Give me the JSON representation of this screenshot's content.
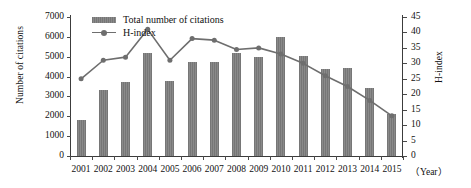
{
  "chart_data": {
    "type": "bar",
    "title": "",
    "xlabel": "（Year）",
    "ylabel": "Number of citations",
    "ylabel_right": "H-index",
    "categories": [
      "2001",
      "2002",
      "2003",
      "2004",
      "2005",
      "2006",
      "2007",
      "2008",
      "2009",
      "2010",
      "2011",
      "2012",
      "2013",
      "2014",
      "2015"
    ],
    "ylim": [
      0,
      7000
    ],
    "yticks": [
      "0",
      "1000",
      "2000",
      "3000",
      "4000",
      "5000",
      "6000",
      "7000"
    ],
    "ylim_right": [
      0,
      45
    ],
    "yticks_right": [
      "0",
      "5",
      "10",
      "15",
      "20",
      "25",
      "30",
      "35",
      "40",
      "45"
    ],
    "grid": false,
    "legend_position": "top-left",
    "series": [
      {
        "name": "Total number of citations",
        "type": "bar",
        "axis": "left",
        "color": "#7d7d7d",
        "values": [
          1800,
          3300,
          3750,
          5200,
          3800,
          4750,
          4750,
          5200,
          5000,
          6000,
          5050,
          4400,
          4450,
          3450,
          2100
        ]
      },
      {
        "name": "H-index",
        "type": "line",
        "axis": "right",
        "color": "#6e6e6e",
        "values": [
          25,
          31,
          32,
          41,
          31,
          38,
          37.5,
          34.5,
          35,
          33,
          30,
          26,
          22.5,
          18,
          13
        ]
      }
    ]
  },
  "legend": {
    "bar_label": "Total number of citations",
    "line_label": "H-index"
  }
}
